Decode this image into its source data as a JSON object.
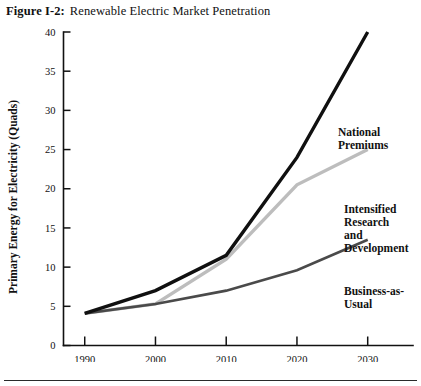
{
  "figure": {
    "label": "Figure I-2:",
    "title": "Renewable Electric Market Penetration"
  },
  "annotations": {
    "national_premiums": "National\nPremiums",
    "intensified_rd": "Intensified\nResearch\nand\nDevelopment",
    "business_as_usual": "Business-as-\nUsual"
  },
  "axis": {
    "x_title": "Year",
    "y_title": "Primary Energy for Electricity (Quads)"
  },
  "colors": {
    "national_premiums": "#101010",
    "intensified_rd": "#bdbdbd",
    "business_as_usual": "#4a4a4a",
    "axis": "#111111",
    "page_background": "#ffffff"
  },
  "chart_data": {
    "type": "line",
    "title": "Renewable Electric Market Penetration",
    "xlabel": "Year",
    "ylabel": "Primary Energy for Electricity (Quads)",
    "x": [
      1990,
      2000,
      2010,
      2020,
      2030
    ],
    "xticks": [
      "1990",
      "2000",
      "2010",
      "2020",
      "2030"
    ],
    "yticks": [
      "0",
      "5",
      "10",
      "15",
      "20",
      "25",
      "30",
      "35",
      "40"
    ],
    "xlim": [
      1987,
      2034
    ],
    "ylim": [
      0,
      40
    ],
    "grid": false,
    "legend": "inline-annotations",
    "series": [
      {
        "name": "National Premiums",
        "color": "#101010",
        "width": 3.4,
        "values": [
          4.1,
          7.0,
          11.5,
          24.0,
          40.0
        ]
      },
      {
        "name": "Intensified Research and Development",
        "color": "#bdbdbd",
        "width": 3.4,
        "values": [
          4.1,
          5.3,
          11.0,
          20.5,
          25.0
        ]
      },
      {
        "name": "Business-as-Usual",
        "color": "#4a4a4a",
        "width": 2.6,
        "values": [
          4.1,
          5.3,
          7.0,
          9.6,
          13.5
        ]
      }
    ]
  }
}
